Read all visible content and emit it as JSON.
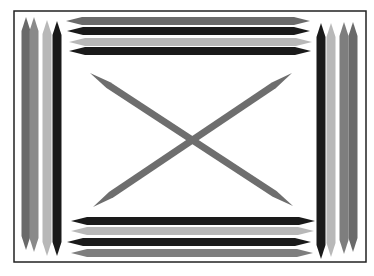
{
  "colors": {
    "background": "#ffffff",
    "frame": "#222222",
    "black": "#1a1a1a",
    "dark_gray": "#6a6a6a",
    "mid_gray": "#7e7e7e",
    "light_gray": "#b8b8b8",
    "x_stick": "#6e6e6e"
  },
  "frame": {
    "x": 14,
    "y": 11,
    "width": 352,
    "height": 251
  },
  "left_sticks": [
    {
      "cx": 26,
      "top": 17,
      "bottom": 250,
      "w": 9,
      "color": "#6a6a6a"
    },
    {
      "cx": 34,
      "top": 17,
      "bottom": 252,
      "w": 9,
      "color": "#8a8a8a"
    },
    {
      "cx": 47,
      "top": 20,
      "bottom": 256,
      "w": 9,
      "color": "#b8b8b8"
    },
    {
      "cx": 57,
      "top": 21,
      "bottom": 256,
      "w": 9,
      "color": "#1a1a1a"
    }
  ],
  "right_sticks": [
    {
      "cx": 321,
      "top": 23,
      "bottom": 259,
      "w": 9,
      "color": "#1a1a1a"
    },
    {
      "cx": 331,
      "top": 23,
      "bottom": 257,
      "w": 9,
      "color": "#b8b8b8"
    },
    {
      "cx": 344,
      "top": 22,
      "bottom": 254,
      "w": 9,
      "color": "#7e7e7e"
    },
    {
      "cx": 353,
      "top": 22,
      "bottom": 252,
      "w": 9,
      "color": "#6a6a6a"
    }
  ],
  "top_sticks": [
    {
      "cy": 21,
      "left": 66,
      "right": 310,
      "h": 8,
      "color": "#6a6a6a"
    },
    {
      "cy": 31,
      "left": 67,
      "right": 310,
      "h": 8,
      "color": "#1a1a1a"
    },
    {
      "cy": 42,
      "left": 69,
      "right": 312,
      "h": 8,
      "color": "#b8b8b8"
    },
    {
      "cy": 51,
      "left": 69,
      "right": 311,
      "h": 8,
      "color": "#1a1a1a"
    }
  ],
  "bottom_sticks": [
    {
      "cy": 221,
      "left": 71,
      "right": 315,
      "h": 8,
      "color": "#1a1a1a"
    },
    {
      "cy": 231,
      "left": 71,
      "right": 314,
      "h": 8,
      "color": "#b8b8b8"
    },
    {
      "cy": 242,
      "left": 67,
      "right": 311,
      "h": 8,
      "color": "#1a1a1a"
    },
    {
      "cy": 253,
      "left": 71,
      "right": 313,
      "h": 8,
      "color": "#7e7e7e"
    }
  ],
  "x_sticks": [
    {
      "x1": 90,
      "y1": 73,
      "x2": 293,
      "y2": 206,
      "w": 7,
      "color": "#6e6e6e"
    },
    {
      "x1": 93,
      "y1": 207,
      "x2": 292,
      "y2": 73,
      "w": 7,
      "color": "#6e6e6e"
    }
  ]
}
